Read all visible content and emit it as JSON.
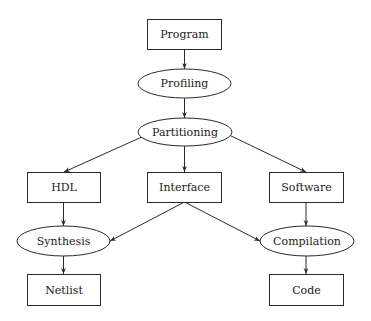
{
  "diagram": {
    "type": "flowchart",
    "nodes": {
      "program": {
        "label": "Program",
        "shape": "rectangle"
      },
      "profiling": {
        "label": "Profiling",
        "shape": "ellipse"
      },
      "partitioning": {
        "label": "Partitioning",
        "shape": "ellipse"
      },
      "hdl": {
        "label": "HDL",
        "shape": "rectangle"
      },
      "interface": {
        "label": "Interface",
        "shape": "rectangle"
      },
      "software": {
        "label": "Software",
        "shape": "rectangle"
      },
      "synthesis": {
        "label": "Synthesis",
        "shape": "ellipse"
      },
      "compilation": {
        "label": "Compilation",
        "shape": "ellipse"
      },
      "netlist": {
        "label": "Netlist",
        "shape": "rectangle"
      },
      "code": {
        "label": "Code",
        "shape": "rectangle"
      }
    },
    "edges": [
      {
        "from": "Program",
        "to": "Profiling"
      },
      {
        "from": "Profiling",
        "to": "Partitioning"
      },
      {
        "from": "Partitioning",
        "to": "HDL"
      },
      {
        "from": "Partitioning",
        "to": "Interface"
      },
      {
        "from": "Partitioning",
        "to": "Software"
      },
      {
        "from": "HDL",
        "to": "Synthesis"
      },
      {
        "from": "Interface",
        "to": "Synthesis"
      },
      {
        "from": "Interface",
        "to": "Compilation"
      },
      {
        "from": "Software",
        "to": "Compilation"
      },
      {
        "from": "Synthesis",
        "to": "Netlist"
      },
      {
        "from": "Compilation",
        "to": "Code"
      }
    ],
    "colors": {
      "stroke": "#2a2a2a",
      "text": "#1a1a1a",
      "background": "#ffffff"
    }
  }
}
